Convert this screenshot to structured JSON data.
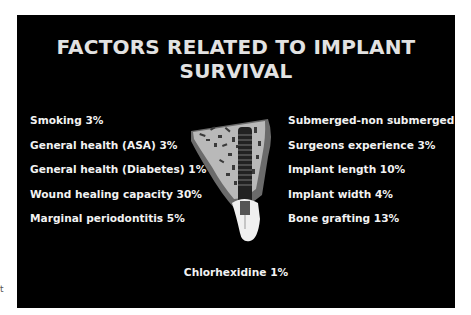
{
  "slide": {
    "title": "FACTORS RELATED TO IMPLANT SURVIVAL",
    "title_lines": [
      "FACTORS RELATED TO IMPLANT",
      "SURVIVAL"
    ],
    "left_factors": [
      {
        "label": "Smoking 3%"
      },
      {
        "label": "General health (ASA) 3%"
      },
      {
        "label": "General health (Diabetes) 1%"
      },
      {
        "label": "Wound healing capacity 30%"
      },
      {
        "label": "Marginal periodontitis 5%"
      }
    ],
    "right_factors": [
      {
        "label": "Submerged-non submerged 7%"
      },
      {
        "label": "Surgeons experience 3%"
      },
      {
        "label": "Implant length 10%"
      },
      {
        "label": "Implant width 4%"
      },
      {
        "label": "Bone grafting 13%"
      }
    ],
    "bottom_factor": "Chlorhexidine 1%",
    "illustration": "dental-implant-in-bone-icon",
    "colors": {
      "background": "#000000",
      "title": "#e2e2e2",
      "text": "#f2f2f2"
    }
  },
  "page": {
    "stray_fragment": "t"
  }
}
